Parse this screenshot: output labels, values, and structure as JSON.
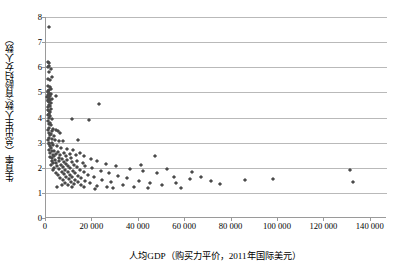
{
  "chart_data": {
    "type": "scatter",
    "title": "",
    "xlabel": "人均GDP（购买力平价，2011年国际美元）",
    "ylabel": "生育率（总出生人数/育龄妇女人数）",
    "xlim": [
      0,
      147000
    ],
    "ylim": [
      0,
      8
    ],
    "grid": true,
    "legend": false,
    "marker": "diamond",
    "marker_color": "#4a4a4a",
    "xticks": [
      0,
      20000,
      40000,
      60000,
      80000,
      100000,
      120000,
      140000
    ],
    "xtick_labels": [
      "0",
      "20 000",
      "40 000",
      "60 000",
      "80 000",
      "100 000",
      "120 000",
      "140 000"
    ],
    "yticks": [
      0,
      1,
      2,
      3,
      4,
      5,
      6,
      7,
      8
    ],
    "ytick_labels": [
      "0",
      "1",
      "2",
      "3",
      "4",
      "5",
      "6",
      "7",
      "8"
    ],
    "points": [
      [
        1400,
        7.6
      ],
      [
        900,
        6.2
      ],
      [
        1500,
        6.15
      ],
      [
        1200,
        6.05
      ],
      [
        700,
        6.0
      ],
      [
        2000,
        5.95
      ],
      [
        1100,
        5.8
      ],
      [
        2600,
        5.6
      ],
      [
        1000,
        5.55
      ],
      [
        1800,
        5.5
      ],
      [
        800,
        5.25
      ],
      [
        1600,
        5.2
      ],
      [
        2300,
        5.15
      ],
      [
        1300,
        5.1
      ],
      [
        700,
        5.05
      ],
      [
        1000,
        5.0
      ],
      [
        1500,
        4.98
      ],
      [
        2100,
        4.95
      ],
      [
        900,
        4.9
      ],
      [
        1200,
        4.88
      ],
      [
        1700,
        4.85
      ],
      [
        4200,
        4.85
      ],
      [
        600,
        4.8
      ],
      [
        1400,
        4.78
      ],
      [
        2400,
        4.75
      ],
      [
        1000,
        4.7
      ],
      [
        1800,
        4.68
      ],
      [
        800,
        4.65
      ],
      [
        1300,
        4.6
      ],
      [
        2000,
        4.58
      ],
      [
        1100,
        4.5
      ],
      [
        1600,
        4.45
      ],
      [
        900,
        4.4
      ],
      [
        2200,
        4.35
      ],
      [
        700,
        4.3
      ],
      [
        1400,
        4.25
      ],
      [
        1900,
        4.2
      ],
      [
        1100,
        4.15
      ],
      [
        800,
        4.1
      ],
      [
        1600,
        4.05
      ],
      [
        1300,
        4.0
      ],
      [
        2500,
        3.95
      ],
      [
        23000,
        4.55
      ],
      [
        18500,
        3.9
      ],
      [
        11000,
        3.95
      ],
      [
        900,
        3.85
      ],
      [
        1800,
        3.8
      ],
      [
        1200,
        3.75
      ],
      [
        2200,
        3.7
      ],
      [
        1500,
        3.6
      ],
      [
        3000,
        3.55
      ],
      [
        1000,
        3.5
      ],
      [
        2600,
        3.45
      ],
      [
        4500,
        3.5
      ],
      [
        5200,
        3.45
      ],
      [
        1300,
        3.4
      ],
      [
        2000,
        3.35
      ],
      [
        6200,
        3.4
      ],
      [
        1700,
        3.3
      ],
      [
        3400,
        3.25
      ],
      [
        1100,
        3.2
      ],
      [
        2400,
        3.15
      ],
      [
        900,
        3.1
      ],
      [
        4000,
        3.1
      ],
      [
        5600,
        3.05
      ],
      [
        1500,
        3.0
      ],
      [
        2800,
        2.98
      ],
      [
        7200,
        3.05
      ],
      [
        1200,
        2.95
      ],
      [
        3200,
        2.9
      ],
      [
        13800,
        3.1
      ],
      [
        1900,
        2.88
      ],
      [
        4800,
        2.85
      ],
      [
        2200,
        2.8
      ],
      [
        6500,
        2.78
      ],
      [
        9200,
        2.75
      ],
      [
        1400,
        2.7
      ],
      [
        3600,
        2.68
      ],
      [
        11500,
        2.72
      ],
      [
        2600,
        2.65
      ],
      [
        5000,
        2.62
      ],
      [
        7800,
        2.6
      ],
      [
        1700,
        2.58
      ],
      [
        4200,
        2.55
      ],
      [
        14500,
        2.6
      ],
      [
        2900,
        2.52
      ],
      [
        10200,
        2.55
      ],
      [
        6000,
        2.5
      ],
      [
        3400,
        2.48
      ],
      [
        8500,
        2.45
      ],
      [
        12800,
        2.5
      ],
      [
        1900,
        2.42
      ],
      [
        5400,
        2.4
      ],
      [
        16500,
        2.45
      ],
      [
        2400,
        2.38
      ],
      [
        7000,
        2.35
      ],
      [
        10800,
        2.38
      ],
      [
        3800,
        2.32
      ],
      [
        9000,
        2.3
      ],
      [
        19500,
        2.35
      ],
      [
        5800,
        2.28
      ],
      [
        2700,
        2.25
      ],
      [
        13200,
        2.28
      ],
      [
        7600,
        2.22
      ],
      [
        4400,
        2.2
      ],
      [
        11200,
        2.22
      ],
      [
        22000,
        2.25
      ],
      [
        3100,
        2.18
      ],
      [
        8800,
        2.15
      ],
      [
        15800,
        2.18
      ],
      [
        6300,
        2.12
      ],
      [
        2200,
        2.1
      ],
      [
        12000,
        2.12
      ],
      [
        26000,
        2.15
      ],
      [
        9600,
        2.08
      ],
      [
        4900,
        2.05
      ],
      [
        17000,
        2.08
      ],
      [
        7400,
        2.02
      ],
      [
        3500,
        2.0
      ],
      [
        13500,
        2.02
      ],
      [
        30000,
        2.05
      ],
      [
        10500,
        1.98
      ],
      [
        5700,
        1.95
      ],
      [
        20000,
        1.98
      ],
      [
        8200,
        1.92
      ],
      [
        2900,
        1.9
      ],
      [
        14800,
        1.92
      ],
      [
        36000,
        1.95
      ],
      [
        11800,
        1.88
      ],
      [
        6700,
        1.85
      ],
      [
        23500,
        1.88
      ],
      [
        9400,
        1.82
      ],
      [
        4100,
        1.8
      ],
      [
        16200,
        1.82
      ],
      [
        42000,
        1.88
      ],
      [
        12600,
        1.78
      ],
      [
        7900,
        1.75
      ],
      [
        27000,
        1.78
      ],
      [
        10200,
        1.72
      ],
      [
        5300,
        1.7
      ],
      [
        18000,
        1.72
      ],
      [
        48000,
        1.78
      ],
      [
        13800,
        1.68
      ],
      [
        8600,
        1.65
      ],
      [
        31000,
        1.68
      ],
      [
        11400,
        1.62
      ],
      [
        6100,
        1.6
      ],
      [
        20500,
        1.62
      ],
      [
        55000,
        1.65
      ],
      [
        15200,
        1.58
      ],
      [
        9800,
        1.55
      ],
      [
        35000,
        1.58
      ],
      [
        12400,
        1.52
      ],
      [
        7200,
        1.5
      ],
      [
        24000,
        1.52
      ],
      [
        62000,
        1.55
      ],
      [
        17000,
        1.48
      ],
      [
        10800,
        1.45
      ],
      [
        40000,
        1.48
      ],
      [
        13600,
        1.42
      ],
      [
        8400,
        1.4
      ],
      [
        28000,
        1.42
      ],
      [
        71000,
        1.48
      ],
      [
        19000,
        1.38
      ],
      [
        12000,
        1.35
      ],
      [
        45000,
        1.4
      ],
      [
        15000,
        1.32
      ],
      [
        9500,
        1.3
      ],
      [
        33000,
        1.32
      ],
      [
        22000,
        1.28
      ],
      [
        16500,
        1.25
      ],
      [
        50000,
        1.3
      ],
      [
        26500,
        1.25
      ],
      [
        38000,
        1.25
      ],
      [
        4700,
        1.25
      ],
      [
        7000,
        1.3
      ],
      [
        11000,
        1.22
      ],
      [
        29000,
        1.2
      ],
      [
        21000,
        1.15
      ],
      [
        44000,
        1.18
      ],
      [
        58000,
        1.2
      ],
      [
        86000,
        1.5
      ],
      [
        98000,
        1.55
      ],
      [
        131000,
        1.9
      ],
      [
        132500,
        1.45
      ],
      [
        63000,
        1.85
      ],
      [
        67000,
        1.62
      ],
      [
        75000,
        1.35
      ],
      [
        52000,
        1.95
      ],
      [
        47000,
        2.45
      ],
      [
        56000,
        1.4
      ],
      [
        41000,
        2.1
      ]
    ]
  }
}
